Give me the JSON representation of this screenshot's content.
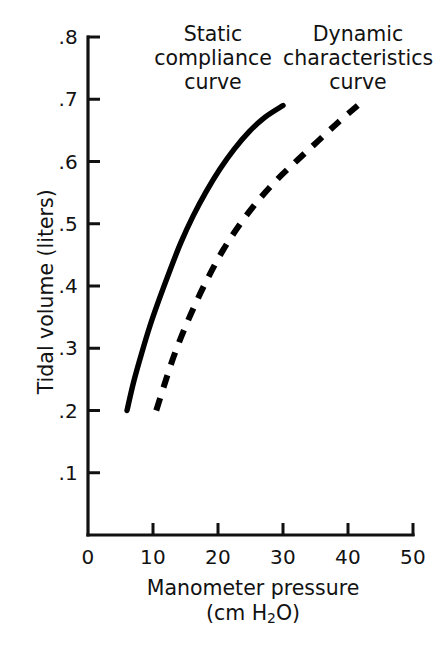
{
  "chart_data": {
    "type": "line",
    "title": "",
    "xlabel": "Manometer pressure (cm H2O)",
    "ylabel": "Tidal volume (liters)",
    "xlim": [
      0,
      50
    ],
    "ylim": [
      0,
      0.8
    ],
    "grid": false,
    "legend_position": "inline-annotations",
    "xticks": [
      "0",
      "10",
      "20",
      "30",
      "40",
      "50"
    ],
    "xtick_values": [
      0,
      10,
      20,
      30,
      40,
      50
    ],
    "yticks": [
      ".1",
      ".2",
      ".3",
      ".4",
      ".5",
      ".6",
      ".7",
      ".8"
    ],
    "ytick_values": [
      0.1,
      0.2,
      0.3,
      0.4,
      0.5,
      0.6,
      0.7,
      0.8
    ],
    "series": [
      {
        "name": "Static compliance curve",
        "style": "solid",
        "color": "#000000",
        "x": [
          6.0,
          7.0,
          8.2,
          9.5,
          11.0,
          12.6,
          14.3,
          16.2,
          18.2,
          20.3,
          22.5,
          24.8,
          27.2,
          30.0
        ],
        "values": [
          0.2,
          0.245,
          0.29,
          0.335,
          0.38,
          0.425,
          0.47,
          0.513,
          0.552,
          0.588,
          0.62,
          0.648,
          0.671,
          0.69
        ]
      },
      {
        "name": "Dynamic characteristics curve",
        "style": "dashed",
        "color": "#000000",
        "x": [
          10.5,
          11.8,
          13.2,
          14.8,
          16.6,
          18.6,
          20.8,
          23.3,
          26.0,
          29.0,
          32.2,
          35.5,
          38.6,
          41.5
        ],
        "values": [
          0.2,
          0.243,
          0.287,
          0.33,
          0.373,
          0.416,
          0.458,
          0.498,
          0.535,
          0.57,
          0.602,
          0.634,
          0.664,
          0.69
        ]
      }
    ]
  },
  "axes": {
    "y_title": "Tidal volume (liters)",
    "x_title_line1": "Manometer pressure",
    "x_title_line2_pre": "(cm H",
    "x_title_line2_sub": "2",
    "x_title_line2_post": "O)"
  },
  "annotations": {
    "static": {
      "line1": "Static",
      "line2": "compliance",
      "line3": "curve"
    },
    "dynamic": {
      "line1": "Dynamic",
      "line2": "characteristics",
      "line3": "curve"
    }
  },
  "colors": {
    "background": "#ffffff",
    "ink": "#121212",
    "curve": "#000000"
  }
}
